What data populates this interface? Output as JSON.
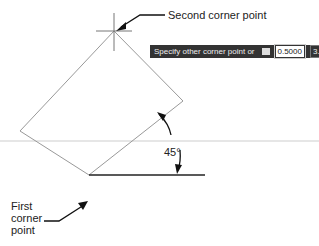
{
  "callouts": {
    "second_corner": "Second corner point",
    "first_corner": [
      "First",
      "corner",
      "point"
    ],
    "angle": "45°"
  },
  "tooltip": {
    "prompt": "Specify other corner point or",
    "icon": "down-arrow-options-icon",
    "width_value": "0.5000",
    "height_value": "3.0000"
  },
  "colors": {
    "rectangle": "#999999",
    "baseline": "#222222",
    "tooltip_bg": "#333333"
  }
}
